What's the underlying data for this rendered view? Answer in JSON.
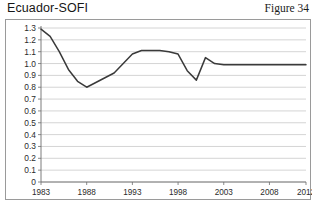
{
  "header": {
    "title": "Ecuador-SOFI",
    "figure_label": "Figure 34"
  },
  "chart_data": {
    "type": "line",
    "title": "Ecuador-SOFI",
    "xlabel": "",
    "ylabel": "",
    "xlim": [
      1983,
      2012
    ],
    "ylim": [
      0,
      1.3
    ],
    "grid": true,
    "grid_axis": "y",
    "legend": false,
    "line_color": "#3a3a3a",
    "x_ticks": [
      "1983",
      "1988",
      "1993",
      "1998",
      "2003",
      "2008",
      "2012"
    ],
    "x_tick_values": [
      1983,
      1988,
      1993,
      1998,
      2003,
      2008,
      2012
    ],
    "y_ticks": [
      "0",
      "0.1",
      "0.2",
      "0.3",
      "0.4",
      "0.5",
      "0.6",
      "0.7",
      "0.8",
      "0.9",
      "1.0",
      "1.1",
      "1.2",
      "1.3"
    ],
    "y_tick_values": [
      0,
      0.1,
      0.2,
      0.3,
      0.4,
      0.5,
      0.6,
      0.7,
      0.8,
      0.9,
      1.0,
      1.1,
      1.2,
      1.3
    ],
    "x": [
      1983,
      1984,
      1985,
      1986,
      1987,
      1988,
      1989,
      1990,
      1991,
      1992,
      1993,
      1994,
      1995,
      1996,
      1997,
      1998,
      1999,
      2000,
      2001,
      2002,
      2003,
      2004,
      2005,
      2006,
      2007,
      2008,
      2009,
      2010,
      2011,
      2012
    ],
    "series": [
      {
        "name": "Ecuador-SOFI",
        "values": [
          1.29,
          1.23,
          1.1,
          0.95,
          0.85,
          0.8,
          0.84,
          0.88,
          0.92,
          1.0,
          1.08,
          1.11,
          1.11,
          1.11,
          1.1,
          1.08,
          0.94,
          0.86,
          1.05,
          1.0,
          0.99,
          0.99,
          0.99,
          0.99,
          0.99,
          0.99,
          0.99,
          0.99,
          0.99,
          0.99
        ]
      }
    ]
  }
}
